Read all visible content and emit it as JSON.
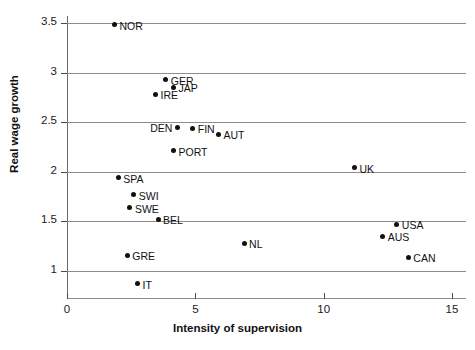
{
  "chart_data": {
    "type": "scatter",
    "title": "",
    "xlabel": "Intensity of supervision",
    "ylabel": "Real wage growth",
    "xlim": [
      0,
      15
    ],
    "ylim": [
      0.75,
      3.6
    ],
    "xticks": [
      0,
      5,
      10,
      15
    ],
    "xtick_labels": [
      "0",
      "5",
      "10",
      "15"
    ],
    "yticks": [
      1,
      1.5,
      2,
      2.5,
      3,
      3.5
    ],
    "ytick_labels": [
      "1",
      "1.5",
      "2",
      "2.5",
      "3",
      "3.5"
    ],
    "grid": "horizontal",
    "legend": "none",
    "marker_color": "#111111",
    "grid_color": "#8d8d8d",
    "points": [
      {
        "label": "NOR",
        "x": 1.85,
        "y": 3.48,
        "label_side": "right"
      },
      {
        "label": "GER",
        "x": 3.85,
        "y": 2.93,
        "label_side": "right"
      },
      {
        "label": "JAP",
        "x": 4.15,
        "y": 2.85,
        "label_side": "right"
      },
      {
        "label": "IRE",
        "x": 3.45,
        "y": 2.78,
        "label_side": "right"
      },
      {
        "label": "DEN",
        "x": 4.3,
        "y": 2.45,
        "label_side": "left"
      },
      {
        "label": "FIN",
        "x": 4.9,
        "y": 2.44,
        "label_side": "right"
      },
      {
        "label": "AUT",
        "x": 5.9,
        "y": 2.38,
        "label_side": "right"
      },
      {
        "label": "PORT",
        "x": 4.15,
        "y": 2.21,
        "label_side": "right"
      },
      {
        "label": "SPA",
        "x": 2.0,
        "y": 1.94,
        "label_side": "right"
      },
      {
        "label": "SWI",
        "x": 2.6,
        "y": 1.77,
        "label_side": "right"
      },
      {
        "label": "SWE",
        "x": 2.45,
        "y": 1.64,
        "label_side": "right"
      },
      {
        "label": "BEL",
        "x": 3.55,
        "y": 1.52,
        "label_side": "right"
      },
      {
        "label": "UK",
        "x": 11.2,
        "y": 2.04,
        "label_side": "right"
      },
      {
        "label": "USA",
        "x": 12.85,
        "y": 1.47,
        "label_side": "right"
      },
      {
        "label": "AUS",
        "x": 12.3,
        "y": 1.35,
        "label_side": "right"
      },
      {
        "label": "NL",
        "x": 6.9,
        "y": 1.28,
        "label_side": "right"
      },
      {
        "label": "CAN",
        "x": 13.3,
        "y": 1.14,
        "label_side": "right"
      },
      {
        "label": "GRE",
        "x": 2.35,
        "y": 1.16,
        "label_side": "right"
      },
      {
        "label": "IT",
        "x": 2.75,
        "y": 0.87,
        "label_side": "right"
      }
    ]
  }
}
